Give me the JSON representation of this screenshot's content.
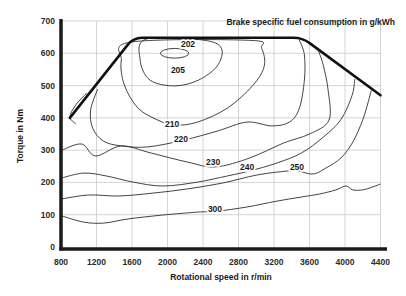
{
  "chart_data": {
    "type": "contour",
    "title": "Brake specific fuel consumption in g/kWh",
    "xlabel": "Rotational speed in r/min",
    "ylabel": "Torque in Nm",
    "xlim": [
      800,
      4400
    ],
    "ylim": [
      0,
      700
    ],
    "x_ticks": [
      800,
      1200,
      1600,
      2000,
      2400,
      2800,
      3200,
      3600,
      4000,
      4400
    ],
    "y_ticks": [
      0,
      100,
      200,
      300,
      400,
      500,
      600,
      700
    ],
    "grid": true,
    "bsfc_unit": "g/kWh",
    "contour_levels": [
      202,
      205,
      210,
      220,
      230,
      240,
      250,
      300
    ],
    "optimum": {
      "speed": 2100,
      "torque": 600,
      "bsfc": 202
    },
    "full_load_curve": [
      [
        900,
        400
      ],
      [
        1614,
        648
      ],
      [
        3520,
        648
      ],
      [
        4400,
        470
      ]
    ],
    "contours": [
      {
        "label": "202",
        "ellipse": {
          "center": [
            2080,
            600
          ],
          "rx": 160,
          "ry": 15
        },
        "label_at": [
          2231,
          629
        ]
      },
      {
        "label": "205",
        "closed": true,
        "label_at": [
          2118,
          548
        ],
        "points": [
          [
            1759,
            644
          ],
          [
            1692,
            579
          ],
          [
            1803,
            517
          ],
          [
            2082,
            499
          ],
          [
            2349,
            517
          ],
          [
            2561,
            561
          ],
          [
            2606,
            616
          ],
          [
            2394,
            641
          ]
        ]
      },
      {
        "label": "210",
        "closed": true,
        "label_at": [
          2051,
          381
        ],
        "points": [
          [
            1591,
            635
          ],
          [
            1480,
            579
          ],
          [
            1513,
            502
          ],
          [
            1669,
            430
          ],
          [
            1892,
            393
          ],
          [
            2082,
            378
          ],
          [
            2338,
            387
          ],
          [
            2673,
            430
          ],
          [
            2960,
            500
          ],
          [
            3090,
            560
          ],
          [
            3060,
            615
          ],
          [
            2940,
            640
          ]
        ]
      },
      {
        "label": "220",
        "closed": false,
        "label_at": [
          2152,
          334
        ],
        "points": [
          [
            1212,
            489
          ],
          [
            1134,
            424
          ],
          [
            1157,
            368
          ],
          [
            1279,
            328
          ],
          [
            1480,
            313
          ],
          [
            1781,
            310
          ],
          [
            2182,
            331
          ],
          [
            2561,
            359
          ],
          [
            2895,
            387
          ],
          [
            3174,
            375
          ],
          [
            3375,
            387
          ],
          [
            3486,
            430
          ],
          [
            3542,
            517
          ],
          [
            3542,
            595
          ],
          [
            3486,
            641
          ]
        ]
      },
      {
        "label": "230",
        "closed": false,
        "label_at": [
          2513,
          263
        ],
        "points": [
          [
            811,
            300
          ],
          [
            1034,
            319
          ],
          [
            1190,
            282
          ],
          [
            1480,
            313
          ],
          [
            1814,
            291
          ],
          [
            2227,
            263
          ],
          [
            2539,
            248
          ],
          [
            2929,
            276
          ],
          [
            3308,
            322
          ],
          [
            3600,
            350
          ],
          [
            3820,
            393
          ],
          [
            3810,
            486
          ],
          [
            3754,
            564
          ],
          [
            3698,
            610
          ]
        ]
      },
      {
        "label": "240",
        "closed": false,
        "label_at": [
          2896,
          248
        ],
        "points": [
          [
            811,
            214
          ],
          [
            1056,
            229
          ],
          [
            1313,
            220
          ],
          [
            1614,
            201
          ],
          [
            1948,
            189
          ],
          [
            2338,
            201
          ],
          [
            2673,
            220
          ],
          [
            2918,
            235
          ],
          [
            3230,
            260
          ],
          [
            3509,
            291
          ],
          [
            3754,
            340
          ],
          [
            3955,
            395
          ],
          [
            4080,
            470
          ],
          [
            4110,
            520
          ]
        ]
      },
      {
        "label": "250",
        "closed": false,
        "label_at": [
          3459,
          248
        ],
        "points": [
          [
            811,
            149
          ],
          [
            1112,
            161
          ],
          [
            1447,
            158
          ],
          [
            1837,
            167
          ],
          [
            2227,
            180
          ],
          [
            2617,
            198
          ],
          [
            3007,
            223
          ],
          [
            3341,
            235
          ],
          [
            3475,
            235
          ],
          [
            3642,
            226
          ],
          [
            3787,
            245
          ],
          [
            3955,
            276
          ],
          [
            4088,
            325
          ],
          [
            4199,
            393
          ],
          [
            4262,
            450
          ],
          [
            4295,
            485
          ]
        ]
      },
      {
        "label": "300",
        "closed": false,
        "label_at": [
          2535,
          118
        ],
        "points": [
          [
            811,
            96
          ],
          [
            1056,
            77
          ],
          [
            1279,
            74
          ],
          [
            1558,
            87
          ],
          [
            1948,
            99
          ],
          [
            2338,
            108
          ],
          [
            2561,
            111
          ],
          [
            2895,
            124
          ],
          [
            3230,
            142
          ],
          [
            3509,
            155
          ],
          [
            3709,
            164
          ],
          [
            3899,
            177
          ],
          [
            4010,
            189
          ],
          [
            4088,
            177
          ],
          [
            4199,
            177
          ],
          [
            4311,
            186
          ],
          [
            4400,
            195
          ]
        ]
      },
      {
        "label": "",
        "closed": false,
        "points": [
          [
            1090,
            477
          ],
          [
            967,
            440
          ],
          [
            900,
            403
          ],
          [
            967,
            381
          ]
        ]
      }
    ],
    "colors": {
      "contour_line": "#2f2f2f",
      "full_load_line": "#111111",
      "grid": "#c9c9c9",
      "axis": "#1a1a1a",
      "text": "#2b2b2b",
      "background": "#ffffff"
    }
  }
}
